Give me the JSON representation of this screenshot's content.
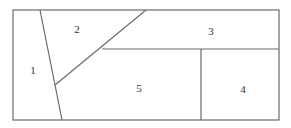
{
  "diagram": {
    "type": "region-partition",
    "stroke_color": "#6b6b6b",
    "background": "#ffffff",
    "outer_rect": {
      "x": 13,
      "y": 10,
      "width": 266,
      "height": 110
    },
    "lines": [
      {
        "name": "slanted-divider",
        "x1": 40,
        "y1": 10,
        "x2": 62,
        "y2": 120
      },
      {
        "name": "diagonal-divider",
        "x1": 55,
        "y1": 85,
        "x2": 146,
        "y2": 10
      },
      {
        "name": "horizontal-divider",
        "x1": 102,
        "y1": 49,
        "x2": 279,
        "y2": 49
      },
      {
        "name": "vertical-divider",
        "x1": 201,
        "y1": 49,
        "x2": 201,
        "y2": 120
      }
    ],
    "regions": [
      {
        "label": "1",
        "x": 33,
        "y": 70
      },
      {
        "label": "2",
        "x": 77,
        "y": 29
      },
      {
        "label": "3",
        "x": 211,
        "y": 31
      },
      {
        "label": "4",
        "x": 243,
        "y": 89
      },
      {
        "label": "5",
        "x": 139,
        "y": 88
      }
    ]
  }
}
